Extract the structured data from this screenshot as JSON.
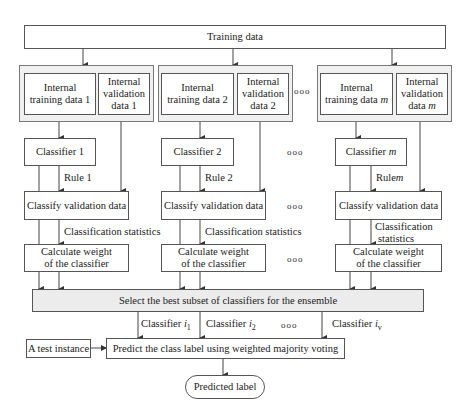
{
  "diagram": {
    "training_data": "Training data",
    "groups": [
      {
        "internal_training": "Internal training data 1",
        "internal_validation": "Internal validation data 1",
        "classifier": "Classifier 1",
        "rule": "Rule 1",
        "classify": "Classify validation data",
        "stats": "Classification statistics",
        "weight": "Calculate weight of the classifier"
      },
      {
        "internal_training": "Internal training data 2",
        "internal_validation": "Internal validation data 2",
        "classifier": "Classifier 2",
        "rule": "Rule 2",
        "classify": "Classify validation data",
        "stats": "Classification statistics",
        "weight": "Calculate weight of the classifier"
      },
      {
        "internal_training": "Internal training data m",
        "internal_validation": "Internal validation data m",
        "classifier": "Classifier m",
        "rule": "Rule m",
        "classify": "Classify validation data",
        "stats": "Classification statistics",
        "weight": "Calculate weight of the classifier"
      }
    ],
    "ellipsis": "ooo",
    "select": "Select the best subset of classifiers for the ensemble",
    "selected_classifiers": [
      "Classifier i1",
      "Classifier i2",
      "Classifier iv"
    ],
    "test_instance": "A test instance",
    "predict": "Predict the class label using weighted majority voting",
    "output": "Predicted label"
  },
  "text": {
    "training_data": "Training data",
    "it_label": "Internal",
    "it1": "training data 1",
    "it2": "training data 2",
    "itm_pre": "training data ",
    "iv_label": "Internal",
    "iv_mid": "validation",
    "iv1": "data 1",
    "iv2": "data 2",
    "ivm_pre": "data ",
    "m": "m",
    "c1": "Classifier 1",
    "c2": "Classifier 2",
    "cm_pre": "Classifier ",
    "rule1": "Rule 1",
    "rule2": "Rule 2",
    "rulem_pre": "Rule",
    "classify": "Classify validation data",
    "stats": "Classification statistics",
    "stats_a": "Classification",
    "stats_b": "statistics",
    "weight_a": "Calculate weight",
    "weight_b": "of the classifier",
    "select": "Select the best subset of classifiers for the ensemble",
    "cls_word": "Classifier ",
    "i": "i",
    "sub1": "1",
    "sub2": "2",
    "subv": "v",
    "dots": "ooo",
    "test": "A test instance",
    "predict": "Predict the class label using weighted majority voting",
    "output": "Predicted label"
  }
}
